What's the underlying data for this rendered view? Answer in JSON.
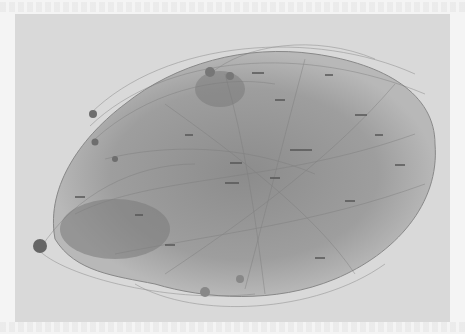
{
  "figure": {
    "type": "network-graph",
    "background_color": "#d9d9d9",
    "page_color": "#f4f4f4",
    "edge_color": "#7a7a7a",
    "node_label_color": "#444444",
    "legible_labels": [],
    "node_labels_note": "Node labels present but illegible at this resolution",
    "clusters": [
      {
        "name": "main-cluster",
        "cx": 250,
        "cy": 160,
        "rx": 190,
        "ry": 130
      },
      {
        "name": "upper-left-satellites",
        "cx": 95,
        "cy": 110
      },
      {
        "name": "left-satellite",
        "cx": 40,
        "cy": 245
      },
      {
        "name": "top-hub-nodes",
        "cx": 215,
        "cy": 75
      }
    ]
  }
}
